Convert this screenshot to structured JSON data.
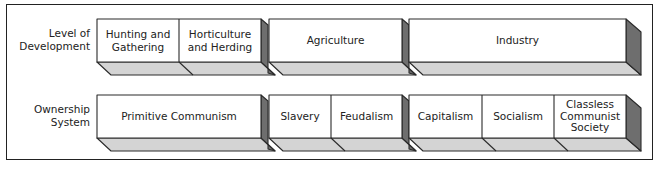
{
  "diagram": {
    "rows": [
      {
        "label": "Level of Development",
        "label_lines": [
          "Level of",
          "Development"
        ],
        "blocks": [
          {
            "cells": [
              {
                "label": "Hunting and Gathering",
                "lines": [
                  "Hunting and",
                  "Gathering"
                ]
              },
              {
                "label": "Horticulture and Herding",
                "lines": [
                  "Horticulture",
                  "and Herding"
                ]
              }
            ]
          },
          {
            "cells": [
              {
                "label": "Agriculture",
                "lines": [
                  "Agriculture"
                ]
              }
            ]
          },
          {
            "cells": [
              {
                "label": "Industry",
                "lines": [
                  "Industry"
                ]
              }
            ]
          }
        ]
      },
      {
        "label": "Ownership System",
        "label_lines": [
          "Ownership",
          "System"
        ],
        "blocks": [
          {
            "cells": [
              {
                "label": "Primitive Communism",
                "lines": [
                  "Primitive Communism"
                ]
              }
            ]
          },
          {
            "cells": [
              {
                "label": "Slavery",
                "lines": [
                  "Slavery"
                ]
              },
              {
                "label": "Feudalism",
                "lines": [
                  "Feudalism"
                ]
              }
            ]
          },
          {
            "cells": [
              {
                "label": "Capitalism",
                "lines": [
                  "Capitalism"
                ]
              },
              {
                "label": "Socialism",
                "lines": [
                  "Socialism"
                ]
              },
              {
                "label": "Classless Communist Society",
                "lines": [
                  "Classless",
                  "Communist",
                  "Society"
                ]
              }
            ]
          }
        ]
      }
    ],
    "colors": {
      "face": "#ffffff",
      "bottom": "#d4d4d4",
      "side": "#6e6e6e",
      "outline": "#2a2a2a",
      "text": "#222222"
    }
  }
}
